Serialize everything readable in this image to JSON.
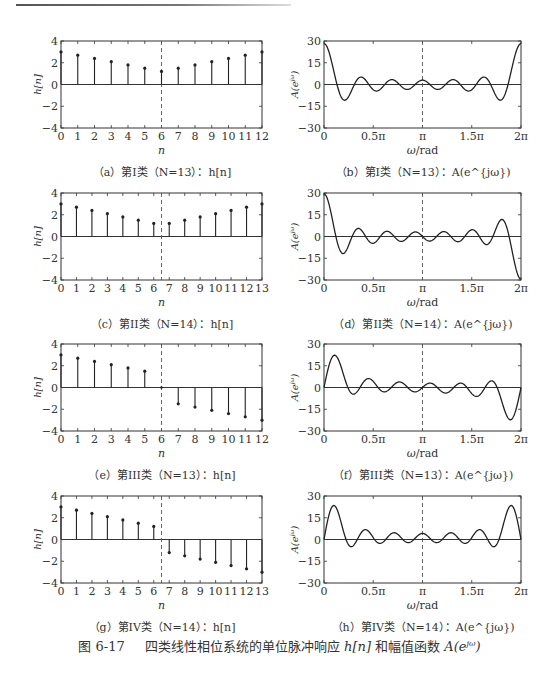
{
  "figure": {
    "number": "图 6-17",
    "title_parts": {
      "text1": "四类线性相位系统的单位脉冲响应",
      "hn": "h[n]",
      "text2": "和幅值函数",
      "A": "A(e",
      "sup": "jω",
      "close": ")"
    }
  },
  "chart_data": [
    {
      "id": "a",
      "type": "stem",
      "caption": "（a）第I类（N=13）：h[n]",
      "xlabel": "n",
      "ylabel": "h[n]",
      "x": [
        0,
        1,
        2,
        3,
        4,
        5,
        6,
        7,
        8,
        9,
        10,
        11,
        12
      ],
      "values": [
        3,
        2.7,
        2.4,
        2.1,
        1.8,
        1.5,
        1.2,
        1.5,
        1.8,
        2.1,
        2.4,
        2.7,
        3
      ],
      "xlim": [
        0,
        12
      ],
      "ylim": [
        -4,
        4
      ],
      "yticks": [
        -4,
        -2,
        0,
        2,
        4
      ],
      "yticklabels": [
        "−4",
        "−2",
        "0",
        "2",
        "4"
      ],
      "xticklabels": [
        "0",
        "1",
        "2",
        "3",
        "4",
        "5",
        "6",
        "7",
        "8",
        "9",
        "10",
        "11",
        "12"
      ],
      "dashed_line_x": 6
    },
    {
      "id": "b",
      "type": "line",
      "caption": "（b）第I类（N=13）：A(e^{jω})",
      "xlabel": "ω/rad",
      "ylabel": "A(e^{jω})",
      "xlim": [
        0,
        6.2832
      ],
      "ylim": [
        -30,
        30
      ],
      "xticklabels": [
        "0",
        "0.5π",
        "π",
        "1.5π",
        "2π"
      ],
      "yticks": [
        -30,
        -15,
        0,
        15,
        30
      ],
      "yticklabels": [
        "−30",
        "−15",
        "0",
        "15",
        "30"
      ],
      "dashed_line_x": 3.1416,
      "formula": "A(ω) = h[6] + 2Σ_{k=1..6} h[6−k]·cos(kω)",
      "kind": "I",
      "h": [
        3,
        2.7,
        2.4,
        2.1,
        1.8,
        1.5,
        1.2,
        1.5,
        1.8,
        2.1,
        2.4,
        2.7,
        3
      ],
      "approx_points": {
        "0": 28.2,
        "0.1π": 0,
        "0.2π": -11,
        "0.4π": 5,
        "π": 3,
        "2π": 28.2
      }
    },
    {
      "id": "c",
      "type": "stem",
      "caption": "（c）第II类（N=14）：h[n]",
      "xlabel": "n",
      "ylabel": "h[n]",
      "x": [
        0,
        1,
        2,
        3,
        4,
        5,
        6,
        7,
        8,
        9,
        10,
        11,
        12,
        13
      ],
      "values": [
        3,
        2.7,
        2.4,
        2.1,
        1.8,
        1.5,
        1.2,
        1.2,
        1.5,
        1.8,
        2.1,
        2.4,
        2.7,
        3
      ],
      "xlim": [
        0,
        13
      ],
      "ylim": [
        -4,
        4
      ],
      "yticks": [
        -4,
        -2,
        0,
        2,
        4
      ],
      "yticklabels": [
        "−4",
        "−2",
        "0",
        "2",
        "4"
      ],
      "xticklabels": [
        "0",
        "1",
        "2",
        "3",
        "4",
        "5",
        "6",
        "7",
        "8",
        "9",
        "10",
        "11",
        "12",
        "13"
      ],
      "dashed_line_x": 6.5
    },
    {
      "id": "d",
      "type": "line",
      "caption": "（d）第II类（N=14）：A(e^{jω})",
      "xlabel": "ω/rad",
      "ylabel": "A(e^{jω})",
      "xlim": [
        0,
        6.2832
      ],
      "ylim": [
        -30,
        30
      ],
      "xticklabels": [
        "0",
        "0.5π",
        "π",
        "1.5π",
        "2π"
      ],
      "yticks": [
        -30,
        -15,
        0,
        15,
        30
      ],
      "yticklabels": [
        "−30",
        "−15",
        "0",
        "15",
        "30"
      ],
      "dashed_line_x": 3.1416,
      "formula": "A(ω) = 2Σ_{n=0..6} h[n]·cos((6.5−n)ω)",
      "kind": "II",
      "h": [
        3,
        2.7,
        2.4,
        2.1,
        1.8,
        1.5,
        1.2,
        1.2,
        1.5,
        1.8,
        2.1,
        2.4,
        2.7,
        3
      ],
      "approx_points": {
        "0": 29.4,
        "0.2π": -12,
        "π": 0,
        "1.8π": 11,
        "2π": -29.4
      }
    },
    {
      "id": "e",
      "type": "stem",
      "caption": "（e）第III类（N=13）：h[n]",
      "xlabel": "n",
      "ylabel": "h[n]",
      "x": [
        0,
        1,
        2,
        3,
        4,
        5,
        6,
        7,
        8,
        9,
        10,
        11,
        12
      ],
      "values": [
        3,
        2.7,
        2.4,
        2.1,
        1.8,
        1.5,
        0,
        -1.5,
        -1.8,
        -2.1,
        -2.4,
        -2.7,
        -3
      ],
      "xlim": [
        0,
        12
      ],
      "ylim": [
        -4,
        4
      ],
      "yticks": [
        -4,
        -2,
        0,
        2,
        4
      ],
      "yticklabels": [
        "−4",
        "−2",
        "0",
        "2",
        "4"
      ],
      "xticklabels": [
        "0",
        "1",
        "2",
        "3",
        "4",
        "5",
        "6",
        "7",
        "8",
        "9",
        "10",
        "11",
        "12"
      ],
      "dashed_line_x": 6
    },
    {
      "id": "f",
      "type": "line",
      "caption": "（f）第III类（N=13）：A(e^{jω})",
      "xlabel": "ω/rad",
      "ylabel": "A(e^{jω})",
      "xlim": [
        0,
        6.2832
      ],
      "ylim": [
        -30,
        30
      ],
      "xticklabels": [
        "0",
        "0.5π",
        "π",
        "1.5π",
        "2π"
      ],
      "yticks": [
        -30,
        -15,
        0,
        15,
        30
      ],
      "yticklabels": [
        "−30",
        "−15",
        "0",
        "15",
        "30"
      ],
      "dashed_line_x": 3.1416,
      "formula": "A(ω) = 2Σ_{n=0..5} h[n]·sin((6−n)ω)",
      "kind": "III",
      "h": [
        3,
        2.7,
        2.4,
        2.1,
        1.8,
        1.5,
        0,
        -1.5,
        -1.8,
        -2.1,
        -2.4,
        -2.7,
        -3
      ],
      "approx_points": {
        "0": 0,
        "0.1π": 22,
        "π": 0,
        "1.9π": -22,
        "2π": 0
      }
    },
    {
      "id": "g",
      "type": "stem",
      "caption": "（g）第IV类（N=14）：h[n]",
      "xlabel": "n",
      "ylabel": "h[n]",
      "x": [
        0,
        1,
        2,
        3,
        4,
        5,
        6,
        7,
        8,
        9,
        10,
        11,
        12,
        13
      ],
      "values": [
        3,
        2.7,
        2.4,
        2.1,
        1.8,
        1.5,
        1.2,
        -1.2,
        -1.5,
        -1.8,
        -2.1,
        -2.4,
        -2.7,
        -3
      ],
      "xlim": [
        0,
        13
      ],
      "ylim": [
        -4,
        4
      ],
      "yticks": [
        -4,
        -2,
        0,
        2,
        4
      ],
      "yticklabels": [
        "−4",
        "−2",
        "0",
        "2",
        "4"
      ],
      "xticklabels": [
        "0",
        "1",
        "2",
        "3",
        "4",
        "5",
        "6",
        "7",
        "8",
        "9",
        "10",
        "11",
        "12",
        "13"
      ],
      "dashed_line_x": 6.5
    },
    {
      "id": "h",
      "type": "line",
      "caption": "（h）第IV类（N=14）：A(e^{jω})",
      "xlabel": "ω/rad",
      "ylabel": "A(e^{jω})",
      "xlim": [
        0,
        6.2832
      ],
      "ylim": [
        -30,
        30
      ],
      "xticklabels": [
        "0",
        "0.5π",
        "π",
        "1.5π",
        "2π"
      ],
      "yticks": [
        -30,
        -15,
        0,
        15,
        30
      ],
      "yticklabels": [
        "−30",
        "−15",
        "0",
        "15",
        "30"
      ],
      "dashed_line_x": 3.1416,
      "formula": "A(ω) = 2Σ_{n=0..6} h[n]·sin((6.5−n)ω)",
      "kind": "IV",
      "h": [
        3,
        2.7,
        2.4,
        2.1,
        1.8,
        1.5,
        1.2,
        -1.2,
        -1.5,
        -1.8,
        -2.1,
        -2.4,
        -2.7,
        -3
      ],
      "approx_points": {
        "0": 0,
        "0.1π": 23,
        "π": 4,
        "1.9π": 23,
        "2π": 0
      }
    }
  ]
}
